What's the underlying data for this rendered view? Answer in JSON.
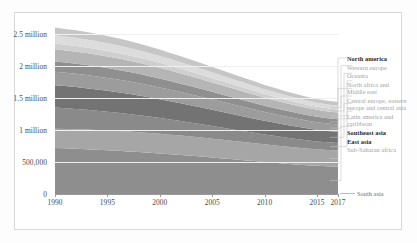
{
  "chart_data": {
    "type": "area",
    "title": "",
    "subtitle": "",
    "xlabel": "",
    "ylabel": "",
    "stacked": true,
    "grid": true,
    "legend_position": "right",
    "xlim": [
      1990,
      2017
    ],
    "ylim": [
      0,
      2750000
    ],
    "x": [
      1990,
      1991,
      1992,
      1993,
      1994,
      1995,
      1996,
      1997,
      1998,
      1999,
      2000,
      2001,
      2002,
      2003,
      2004,
      2005,
      2006,
      2007,
      2008,
      2009,
      2010,
      2011,
      2012,
      2013,
      2014,
      2015,
      2016,
      2017
    ],
    "xticks": [
      1990,
      1995,
      2000,
      2005,
      2010,
      2015,
      2017
    ],
    "xticklabels": [
      "1990",
      "1995",
      "2000",
      "2005",
      "2010",
      "2015",
      "2017"
    ],
    "yticks": [
      0,
      500000,
      1000000,
      1500000,
      2000000,
      2500000
    ],
    "yticklabels": [
      "0",
      "500,000",
      "1 million",
      "1.5 million",
      "2 million",
      "2.5 million"
    ],
    "series": [
      {
        "name": "South asia",
        "color": "#8e8e8e",
        "values": [
          720000,
          714000,
          707000,
          700000,
          692000,
          684000,
          675000,
          666000,
          656000,
          645000,
          634000,
          622000,
          610000,
          597000,
          584000,
          570000,
          556000,
          542000,
          528000,
          514000,
          500000,
          487000,
          474000,
          462000,
          450000,
          440000,
          432000,
          426000
        ]
      },
      {
        "name": "Sub-Saharan africa",
        "color": "#a6a6a6",
        "values": [
          300000,
          302000,
          304000,
          306000,
          307000,
          308000,
          309000,
          309000,
          309000,
          308000,
          307000,
          305000,
          303000,
          301000,
          298000,
          295000,
          291000,
          288000,
          284000,
          280000,
          276000,
          272000,
          268000,
          265000,
          262000,
          259000,
          257000,
          256000
        ]
      },
      {
        "name": "East asia",
        "color": "#8a8a8a",
        "values": [
          330000,
          324000,
          317000,
          310000,
          302000,
          294000,
          285000,
          276000,
          267000,
          257000,
          247000,
          237000,
          227000,
          217000,
          207000,
          197000,
          188000,
          179000,
          170000,
          162000,
          154000,
          147000,
          140000,
          134000,
          128000,
          123000,
          119000,
          116000
        ]
      },
      {
        "name": "Southeast asia",
        "color": "#737373",
        "values": [
          350000,
          346000,
          342000,
          337000,
          332000,
          326000,
          320000,
          314000,
          307000,
          300000,
          293000,
          285000,
          277000,
          269000,
          261000,
          253000,
          245000,
          237000,
          229000,
          221000,
          213000,
          206000,
          199000,
          193000,
          187000,
          182000,
          178000,
          175000
        ]
      },
      {
        "name": "Latin america and caribbean",
        "color": "#9c9c9c",
        "values": [
          210000,
          209000,
          208000,
          206000,
          204000,
          202000,
          199000,
          196000,
          193000,
          189000,
          185000,
          181000,
          176000,
          172000,
          167000,
          162000,
          157000,
          152000,
          147000,
          142000,
          137000,
          133000,
          129000,
          125000,
          121000,
          118000,
          115000,
          113000
        ]
      },
      {
        "name": "Central europe, eastern europe and central asia",
        "color": "#8f8f8f",
        "values": [
          160000,
          159000,
          158000,
          157000,
          155000,
          153000,
          151000,
          148000,
          145000,
          142000,
          139000,
          135000,
          131000,
          127000,
          123000,
          119000,
          115000,
          111000,
          107000,
          103000,
          99000,
          96000,
          93000,
          90000,
          87000,
          85000,
          83000,
          82000
        ]
      },
      {
        "name": "North africa and Middle east",
        "color": "#b5b5b5",
        "values": [
          190000,
          189000,
          188000,
          187000,
          185000,
          183000,
          181000,
          178000,
          175000,
          172000,
          168000,
          164000,
          160000,
          156000,
          152000,
          147000,
          143000,
          138000,
          134000,
          129000,
          125000,
          121000,
          117000,
          114000,
          111000,
          108000,
          106000,
          105000
        ]
      },
      {
        "name": "Oceania",
        "color": "#cfcfcf",
        "values": [
          90000,
          89000,
          88000,
          87000,
          86000,
          85000,
          84000,
          82000,
          81000,
          79000,
          77000,
          75000,
          73000,
          71000,
          69000,
          67000,
          65000,
          63000,
          61000,
          59000,
          57000,
          55000,
          53000,
          52000,
          50000,
          49000,
          48000,
          47000
        ]
      },
      {
        "name": "Western europe",
        "color": "#dcdcdc",
        "values": [
          130000,
          129000,
          128000,
          126000,
          124000,
          122000,
          120000,
          117000,
          114000,
          111000,
          108000,
          105000,
          101000,
          98000,
          94000,
          91000,
          87000,
          84000,
          81000,
          78000,
          75000,
          72000,
          69000,
          67000,
          65000,
          63000,
          61000,
          60000
        ]
      },
      {
        "name": "North america",
        "color": "#c6c6c6",
        "values": [
          120000,
          119000,
          117000,
          116000,
          114000,
          112000,
          110000,
          107000,
          105000,
          102000,
          99000,
          96000,
          93000,
          90000,
          87000,
          84000,
          81000,
          78000,
          75000,
          72000,
          69000,
          66000,
          64000,
          62000,
          60000,
          58000,
          57000,
          56000
        ]
      }
    ]
  },
  "legend": {
    "entries": [
      {
        "label": "North america",
        "bold": true
      },
      {
        "label": "Western europe",
        "bold": false
      },
      {
        "label": "Oceania",
        "bold": false
      },
      {
        "label": "North africa and Middle east",
        "bold": false
      },
      {
        "label": "Central europe, eastern europe and central asia",
        "bold": false
      },
      {
        "label": "Latin america and caribbean",
        "bold": false
      },
      {
        "label": "Southeast asia",
        "bold": true
      },
      {
        "label": "East asia",
        "bold": true
      },
      {
        "label": "Sub-Saharan africa",
        "bold": false
      }
    ],
    "callout": {
      "label": "South asia"
    }
  }
}
